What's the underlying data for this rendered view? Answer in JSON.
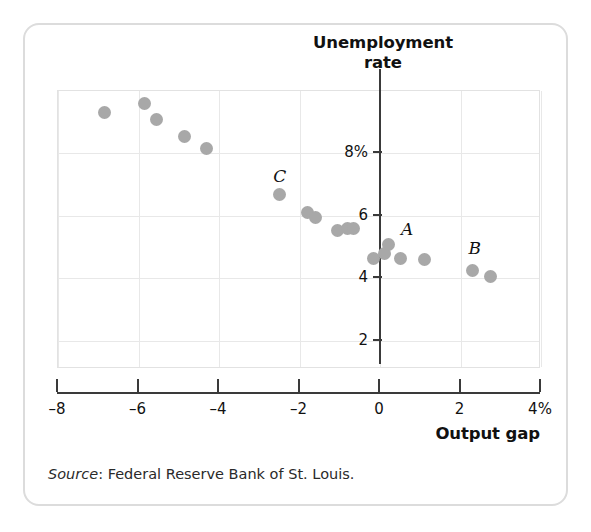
{
  "chart_data": {
    "type": "scatter",
    "title": "Unemployment rate",
    "title_line1": "Unemployment",
    "title_line2": "rate",
    "xlabel": "Output gap",
    "ylabel": "Unemployment rate",
    "xlim": [
      -8,
      4
    ],
    "ylim": [
      1.1,
      10.0
    ],
    "xticks": [
      -8,
      -6,
      -4,
      -2,
      0,
      2,
      4
    ],
    "xtick_labels": [
      "–8",
      "–6",
      "–4",
      "–2",
      "0",
      "2",
      "4%"
    ],
    "yticks": [
      8,
      6,
      4,
      2
    ],
    "ytick_labels": [
      "8%",
      "6",
      "4",
      "2"
    ],
    "grid": true,
    "legend": null,
    "marker_color": "#a8a8a8",
    "points": [
      {
        "x": -6.85,
        "y": 9.3,
        "label": ""
      },
      {
        "x": -5.85,
        "y": 9.6,
        "label": ""
      },
      {
        "x": -5.55,
        "y": 9.1,
        "label": ""
      },
      {
        "x": -4.85,
        "y": 8.55,
        "label": ""
      },
      {
        "x": -4.3,
        "y": 8.15,
        "label": ""
      },
      {
        "x": -2.5,
        "y": 6.7,
        "label": "C"
      },
      {
        "x": -1.8,
        "y": 6.1,
        "label": ""
      },
      {
        "x": -1.6,
        "y": 5.95,
        "label": ""
      },
      {
        "x": -1.05,
        "y": 5.55,
        "label": ""
      },
      {
        "x": -0.8,
        "y": 5.6,
        "label": ""
      },
      {
        "x": -0.65,
        "y": 5.6,
        "label": ""
      },
      {
        "x": -0.15,
        "y": 4.65,
        "label": ""
      },
      {
        "x": 0.1,
        "y": 4.8,
        "label": ""
      },
      {
        "x": 0.2,
        "y": 5.1,
        "label": "A"
      },
      {
        "x": 0.5,
        "y": 4.65,
        "label": ""
      },
      {
        "x": 1.1,
        "y": 4.6,
        "label": ""
      },
      {
        "x": 2.3,
        "y": 4.25,
        "label": "B"
      },
      {
        "x": 2.75,
        "y": 4.05,
        "label": ""
      }
    ],
    "annotations": [
      {
        "text": "C",
        "x": -2.55,
        "y": 7.25
      },
      {
        "text": "A",
        "x": 0.62,
        "y": 5.55
      },
      {
        "text": "B",
        "x": 2.3,
        "y": 4.95
      }
    ]
  },
  "source": {
    "prefix": "Source",
    "separator": ": ",
    "text": "Federal Reserve Bank of St. Louis."
  },
  "colors": {
    "marker": "#a8a8a8",
    "axis": "#3a3a3a",
    "grid": "#e8e8e8",
    "frame": "#dcdcdc",
    "text": "#111111"
  }
}
